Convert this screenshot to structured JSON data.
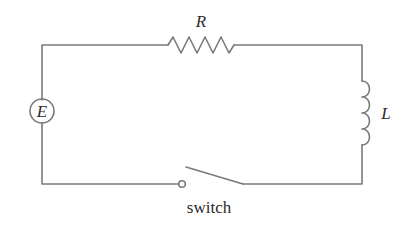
{
  "diagram": {
    "type": "RL circuit",
    "components": {
      "source": {
        "label": "E",
        "symbol": "circle-source"
      },
      "resistor": {
        "label": "R",
        "symbol": "zigzag"
      },
      "inductor": {
        "label": "L",
        "symbol": "coil"
      },
      "switch": {
        "label": "switch",
        "state": "open"
      }
    },
    "colors": {
      "wire": "#7a7a7a",
      "text": "#2a2a2a",
      "background": "#ffffff"
    }
  }
}
